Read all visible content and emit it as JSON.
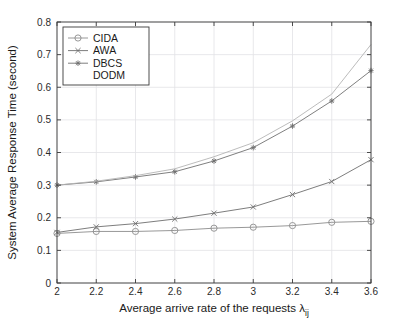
{
  "chart_data": {
    "type": "line",
    "title": "",
    "xlabel": "Average arrive rate of the requests λ",
    "xlabel_sub": "ij",
    "ylabel": "System Average Response Time (second)",
    "x": [
      2,
      2.2,
      2.4,
      2.6,
      2.8,
      3,
      3.2,
      3.4,
      3.6
    ],
    "xticklabels": [
      "2",
      "2.2",
      "2.4",
      "2.6",
      "2.8",
      "3",
      "3.2",
      "3.4",
      "3.6"
    ],
    "yticklabels": [
      "0",
      "0.1",
      "0.2",
      "0.3",
      "0.4",
      "0.5",
      "0.6",
      "0.7",
      "0.8"
    ],
    "xlim": [
      2,
      3.6
    ],
    "ylim": [
      0,
      0.8
    ],
    "grid": true,
    "legend_position": "top-left",
    "series": [
      {
        "name": "CIDA",
        "marker": "circle",
        "color": "#8c8c8c",
        "values": [
          0.152,
          0.158,
          0.158,
          0.161,
          0.168,
          0.171,
          0.176,
          0.186,
          0.189
        ]
      },
      {
        "name": "AWA",
        "marker": "x",
        "color": "#6e6e6e",
        "values": [
          0.155,
          0.172,
          0.182,
          0.196,
          0.214,
          0.233,
          0.271,
          0.311,
          0.378
        ]
      },
      {
        "name": "DBCS",
        "marker": "asterisk",
        "color": "#707070",
        "values": [
          0.3,
          0.31,
          0.325,
          0.341,
          0.374,
          0.415,
          0.481,
          0.558,
          0.651
        ]
      },
      {
        "name": "DODM",
        "marker": "none",
        "color": "#b4b4b4",
        "values": [
          0.3,
          0.312,
          0.329,
          0.35,
          0.387,
          0.43,
          0.497,
          0.579,
          0.731
        ]
      }
    ]
  }
}
